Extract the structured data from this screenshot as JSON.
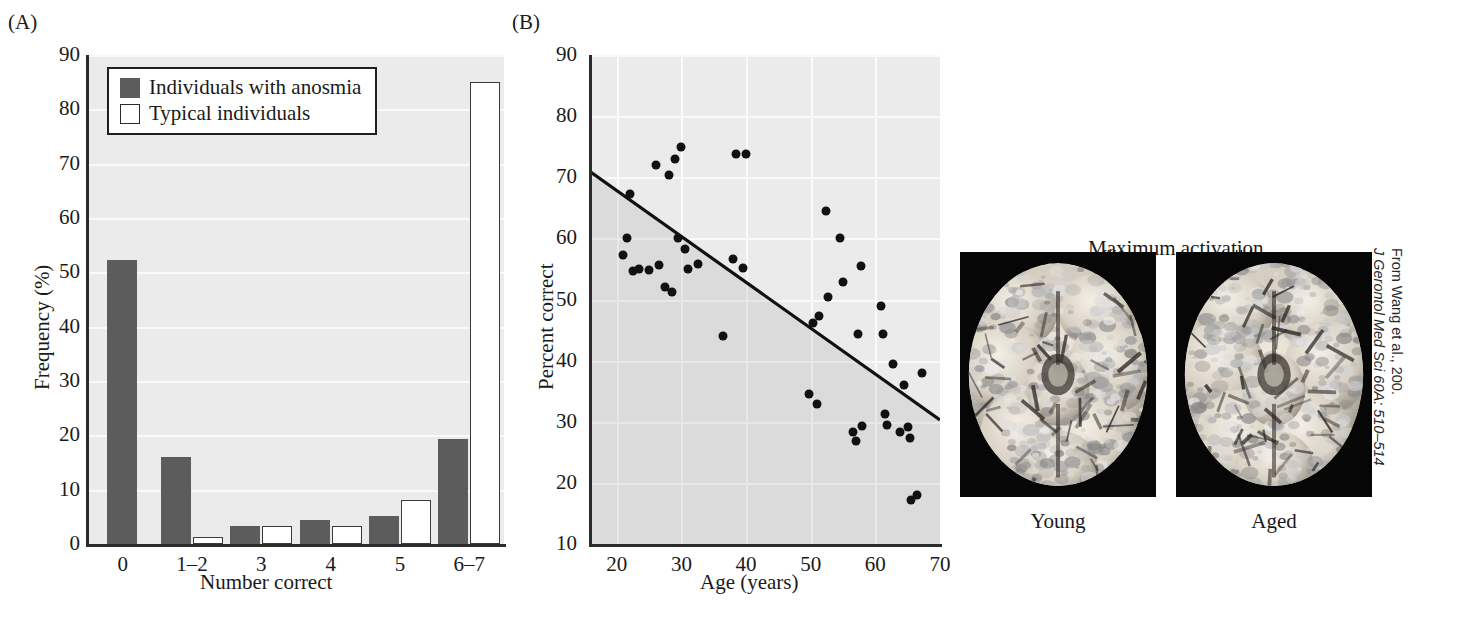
{
  "figure": {
    "credit_line1": "From Wang et al., 200.",
    "credit_line2": "J Gerontol Med Sci 60A: 510–514"
  },
  "panelA": {
    "tag": "(A)",
    "legend": {
      "items": [
        {
          "label": "Individuals with anosmia",
          "swatch": "dark"
        },
        {
          "label": "Typical individuals",
          "swatch": "light"
        }
      ]
    },
    "chart_data": {
      "type": "bar",
      "title": "",
      "xlabel": "Number correct",
      "ylabel": "Frequency (%)",
      "categories": [
        "0",
        "1–2",
        "3",
        "4",
        "5",
        "6–7"
      ],
      "series": [
        {
          "name": "Individuals with anosmia",
          "values": [
            52.2,
            16.1,
            3.4,
            4.4,
            5.2,
            19.4
          ]
        },
        {
          "name": "Typical individuals",
          "values": [
            0,
            1.3,
            3.4,
            3.4,
            8.1,
            85.0
          ]
        }
      ],
      "ylim": [
        0,
        90
      ],
      "yticks": [
        0,
        10,
        20,
        30,
        40,
        50,
        60,
        70,
        80,
        90
      ],
      "grid": true,
      "legend_position": "upper-left"
    }
  },
  "panelB": {
    "tag": "(B)",
    "chart_data": {
      "type": "scatter",
      "title": "",
      "xlabel": "Age (years)",
      "ylabel": "Percent correct",
      "xlim": [
        16,
        70
      ],
      "ylim": [
        10,
        90
      ],
      "xticks": [
        20,
        30,
        40,
        50,
        60,
        70
      ],
      "yticks": [
        10,
        20,
        30,
        40,
        50,
        60,
        70,
        80,
        90
      ],
      "grid": true,
      "points": [
        {
          "x": 21.0,
          "y": 57.3
        },
        {
          "x": 21.5,
          "y": 60.0
        },
        {
          "x": 22.0,
          "y": 67.3
        },
        {
          "x": 22.5,
          "y": 54.6
        },
        {
          "x": 23.5,
          "y": 55.0
        },
        {
          "x": 25.0,
          "y": 54.9
        },
        {
          "x": 26.0,
          "y": 72.0
        },
        {
          "x": 26.5,
          "y": 55.6
        },
        {
          "x": 27.5,
          "y": 52.0
        },
        {
          "x": 28.0,
          "y": 70.3
        },
        {
          "x": 28.5,
          "y": 51.3
        },
        {
          "x": 29.0,
          "y": 73.0
        },
        {
          "x": 29.5,
          "y": 60.0
        },
        {
          "x": 30.0,
          "y": 75.0
        },
        {
          "x": 30.5,
          "y": 58.2
        },
        {
          "x": 31.0,
          "y": 55.0
        },
        {
          "x": 32.5,
          "y": 55.8
        },
        {
          "x": 36.5,
          "y": 44.1
        },
        {
          "x": 38.5,
          "y": 73.8
        },
        {
          "x": 40.0,
          "y": 73.8
        },
        {
          "x": 38.0,
          "y": 56.6
        },
        {
          "x": 39.5,
          "y": 55.1
        },
        {
          "x": 49.8,
          "y": 34.5
        },
        {
          "x": 50.3,
          "y": 46.2
        },
        {
          "x": 51.0,
          "y": 32.9
        },
        {
          "x": 51.3,
          "y": 47.3
        },
        {
          "x": 52.3,
          "y": 64.5
        },
        {
          "x": 52.6,
          "y": 50.4
        },
        {
          "x": 54.5,
          "y": 60.1
        },
        {
          "x": 55.0,
          "y": 52.9
        },
        {
          "x": 56.5,
          "y": 28.4
        },
        {
          "x": 57.0,
          "y": 26.9
        },
        {
          "x": 57.3,
          "y": 44.4
        },
        {
          "x": 57.8,
          "y": 55.5
        },
        {
          "x": 58.0,
          "y": 29.3
        },
        {
          "x": 60.8,
          "y": 49.0
        },
        {
          "x": 61.2,
          "y": 44.4
        },
        {
          "x": 61.5,
          "y": 31.2
        },
        {
          "x": 61.8,
          "y": 29.4
        },
        {
          "x": 62.8,
          "y": 39.5
        },
        {
          "x": 63.8,
          "y": 28.4
        },
        {
          "x": 64.5,
          "y": 36.0
        },
        {
          "x": 65.0,
          "y": 29.2
        },
        {
          "x": 65.3,
          "y": 27.3
        },
        {
          "x": 65.5,
          "y": 17.2
        },
        {
          "x": 66.5,
          "y": 18.0
        },
        {
          "x": 67.2,
          "y": 38.0
        }
      ],
      "fit_line": {
        "x0": 16,
        "y0": 70.8,
        "x1": 70,
        "y1": 30.3
      }
    }
  },
  "panelC": {
    "tag": "(C)",
    "annotation": "Maximum activation",
    "images": [
      {
        "caption": "Young",
        "alt": "brain-young"
      },
      {
        "caption": "Aged",
        "alt": "brain-aged"
      }
    ]
  }
}
